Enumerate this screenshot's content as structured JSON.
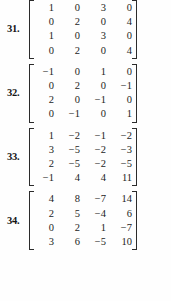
{
  "page": {
    "kind": "textbook-exercise-list",
    "text_color": "#1c1c1c",
    "background_color": "#ffffff"
  },
  "exercises": [
    {
      "label": "31.",
      "matrix": [
        [
          "1",
          "0",
          "3",
          "0"
        ],
        [
          "0",
          "2",
          "0",
          "4"
        ],
        [
          "1",
          "0",
          "3",
          "0"
        ],
        [
          "0",
          "2",
          "0",
          "4"
        ]
      ]
    },
    {
      "label": "32.",
      "matrix": [
        [
          "−1",
          "0",
          "1",
          "0"
        ],
        [
          "0",
          "2",
          "0",
          "−1"
        ],
        [
          "2",
          "0",
          "−1",
          "0"
        ],
        [
          "0",
          "−1",
          "0",
          "1"
        ]
      ]
    },
    {
      "label": "33.",
      "matrix": [
        [
          "1",
          "−2",
          "−1",
          "−2"
        ],
        [
          "3",
          "−5",
          "−2",
          "−3"
        ],
        [
          "2",
          "−5",
          "−2",
          "−5"
        ],
        [
          "−1",
          "4",
          "4",
          "11"
        ]
      ]
    },
    {
      "label": "34.",
      "matrix": [
        [
          "4",
          "8",
          "−7",
          "14"
        ],
        [
          "2",
          "5",
          "−4",
          "6"
        ],
        [
          "0",
          "2",
          "1",
          "−7"
        ],
        [
          "3",
          "6",
          "−5",
          "10"
        ]
      ]
    }
  ]
}
